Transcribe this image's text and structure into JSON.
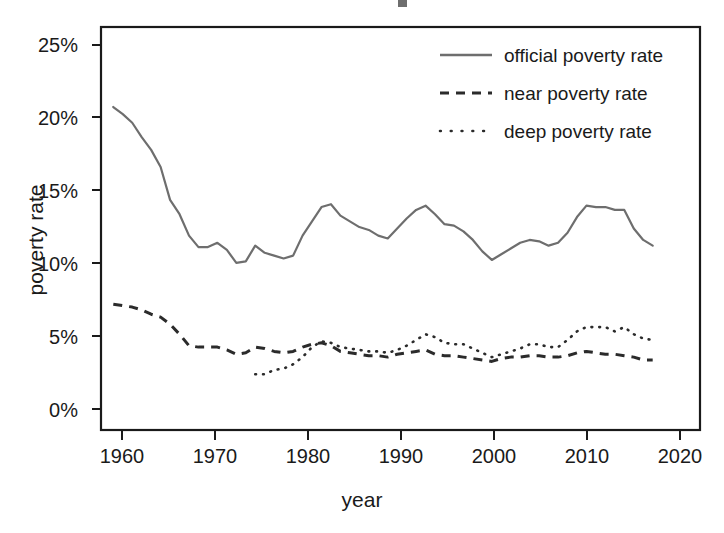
{
  "figure": {
    "background": "#ffffff",
    "frame_color": "#1a1a1a",
    "plot_area": {
      "left": 101,
      "top": 27,
      "right": 700,
      "bottom": 430
    }
  },
  "axes": {
    "x": {
      "label": "year",
      "ticks": [
        1960,
        1970,
        1980,
        1990,
        2000,
        2010,
        2020
      ],
      "tick_labels": [
        "1960",
        "1970",
        "1980",
        "1990",
        "2000",
        "2010",
        "2020"
      ],
      "range": [
        1958.7,
        2022.0
      ]
    },
    "y": {
      "label": "poverty rate",
      "ticks": [
        0,
        5,
        10,
        15,
        20,
        25
      ],
      "tick_labels": [
        "0%",
        "5%",
        "10%",
        "15%",
        "20%",
        "25%"
      ],
      "range": [
        -0.6,
        27.6
      ]
    }
  },
  "legend": {
    "position": "top-right",
    "entries": [
      {
        "label": "official poverty rate",
        "style": "solid",
        "color": "#6e6e6e"
      },
      {
        "label": "near poverty rate",
        "style": "dashed",
        "color": "#2b2b2b"
      },
      {
        "label": "deep poverty rate",
        "style": "dotted",
        "color": "#2b2b2b"
      }
    ]
  },
  "chart_data": {
    "type": "line",
    "title": "",
    "subtitle": "",
    "xlabel": "year",
    "ylabel": "poverty rate",
    "xlim": [
      1958.7,
      2022.0
    ],
    "ylim": [
      -0.6,
      27.6
    ],
    "grid": false,
    "legend_position": "top-right",
    "units": "percent",
    "series": [
      {
        "name": "official poverty rate",
        "style": "solid",
        "color": "#6e6e6e",
        "x": [
          1960,
          1961,
          1962,
          1963,
          1964,
          1965,
          1966,
          1967,
          1968,
          1969,
          1970,
          1971,
          1972,
          1973,
          1974,
          1975,
          1976,
          1977,
          1978,
          1979,
          1980,
          1981,
          1982,
          1983,
          1984,
          1985,
          1986,
          1987,
          1988,
          1989,
          1990,
          1991,
          1992,
          1993,
          1994,
          1995,
          1996,
          1997,
          1998,
          1999,
          2000,
          2001,
          2002,
          2003,
          2004,
          2005,
          2006,
          2007,
          2008,
          2009,
          2010,
          2011,
          2012,
          2013,
          2014,
          2015,
          2016,
          2017
        ],
        "values": [
          22.0,
          21.5,
          20.9,
          19.9,
          19.0,
          17.8,
          15.5,
          14.5,
          13.0,
          12.2,
          12.2,
          12.5,
          12.0,
          11.1,
          11.2,
          12.3,
          11.8,
          11.6,
          11.4,
          11.6,
          13.0,
          14.0,
          15.0,
          15.2,
          14.4,
          14.0,
          13.6,
          13.4,
          13.0,
          12.8,
          13.5,
          14.2,
          14.8,
          15.1,
          14.5,
          13.8,
          13.7,
          13.3,
          12.7,
          11.9,
          11.3,
          11.7,
          12.1,
          12.5,
          12.7,
          12.6,
          12.3,
          12.5,
          13.2,
          14.3,
          15.1,
          15.0,
          15.0,
          14.8,
          14.8,
          13.5,
          12.7,
          12.3
        ]
      },
      {
        "name": "near poverty rate",
        "style": "dashed",
        "color": "#2b2b2b",
        "x": [
          1960,
          1961,
          1962,
          1963,
          1964,
          1965,
          1966,
          1967,
          1968,
          1969,
          1970,
          1971,
          1972,
          1973,
          1974,
          1975,
          1976,
          1977,
          1978,
          1979,
          1980,
          1981,
          1982,
          1983,
          1984,
          1985,
          1986,
          1987,
          1988,
          1989,
          1990,
          1991,
          1992,
          1993,
          1994,
          1995,
          1996,
          1997,
          1998,
          1999,
          2000,
          2001,
          2002,
          2003,
          2004,
          2005,
          2006,
          2007,
          2008,
          2009,
          2010,
          2011,
          2012,
          2013,
          2014,
          2015,
          2016,
          2017
        ],
        "values": [
          8.2,
          8.1,
          8.0,
          7.8,
          7.5,
          7.3,
          6.8,
          6.1,
          5.3,
          5.2,
          5.2,
          5.2,
          5.0,
          4.7,
          4.8,
          5.2,
          5.1,
          4.9,
          4.8,
          4.9,
          5.2,
          5.4,
          5.5,
          5.3,
          4.9,
          4.8,
          4.7,
          4.6,
          4.6,
          4.5,
          4.7,
          4.8,
          4.9,
          5.0,
          4.7,
          4.6,
          4.6,
          4.5,
          4.4,
          4.3,
          4.2,
          4.4,
          4.5,
          4.5,
          4.6,
          4.6,
          4.5,
          4.5,
          4.6,
          4.8,
          4.9,
          4.8,
          4.7,
          4.7,
          4.6,
          4.5,
          4.3,
          4.3
        ]
      },
      {
        "name": "deep poverty rate",
        "style": "dotted",
        "color": "#2b2b2b",
        "x": [
          1975,
          1976,
          1977,
          1978,
          1979,
          1980,
          1981,
          1982,
          1983,
          1984,
          1985,
          1986,
          1987,
          1988,
          1989,
          1990,
          1991,
          1992,
          1993,
          1994,
          1995,
          1996,
          1997,
          1998,
          1999,
          2000,
          2001,
          2002,
          2003,
          2004,
          2005,
          2006,
          2007,
          2008,
          2009,
          2010,
          2011,
          2012,
          2013,
          2014,
          2015,
          2016,
          2017
        ],
        "values": [
          3.3,
          3.3,
          3.6,
          3.7,
          4.0,
          4.5,
          5.2,
          5.6,
          5.5,
          5.2,
          5.1,
          5.0,
          4.9,
          4.9,
          4.8,
          5.0,
          5.3,
          5.7,
          6.1,
          5.9,
          5.5,
          5.4,
          5.4,
          5.1,
          4.8,
          4.5,
          4.7,
          4.9,
          5.1,
          5.4,
          5.4,
          5.2,
          5.2,
          5.7,
          6.3,
          6.6,
          6.6,
          6.6,
          6.3,
          6.6,
          6.1,
          5.8,
          5.7
        ]
      }
    ]
  }
}
